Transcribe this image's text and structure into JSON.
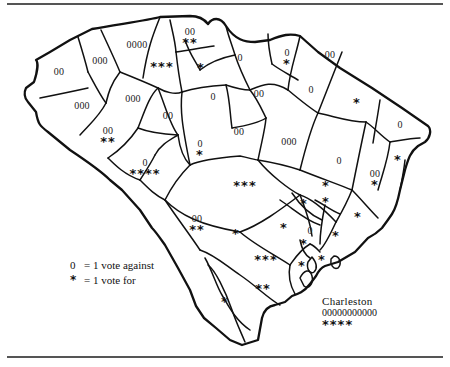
{
  "map": {
    "subject": "South Carolina counties — votes by county",
    "legend": {
      "against_symbol": "0",
      "against_label": "= 1 vote against",
      "for_symbol": "*",
      "for_label": "= 1 vote for"
    },
    "counties": [
      {
        "id": "c1",
        "against": "00",
        "for": ""
      },
      {
        "id": "c2",
        "against": "000",
        "for": ""
      },
      {
        "id": "c3",
        "against": "0000",
        "for": ""
      },
      {
        "id": "c4",
        "against": "",
        "for": "***"
      },
      {
        "id": "c5",
        "against": "00",
        "for": "**"
      },
      {
        "id": "c6",
        "against": "",
        "for": "*"
      },
      {
        "id": "c7",
        "against": "000",
        "for": ""
      },
      {
        "id": "c8",
        "against": "000",
        "for": ""
      },
      {
        "id": "c9",
        "against": "00",
        "for": ""
      },
      {
        "id": "c10",
        "against": "0",
        "for": ""
      },
      {
        "id": "c11",
        "against": "00",
        "for": "**"
      },
      {
        "id": "c12",
        "against": "0",
        "for": "****"
      },
      {
        "id": "c13",
        "against": "0",
        "for": "*"
      },
      {
        "id": "c14",
        "against": "0",
        "for": ""
      },
      {
        "id": "c15",
        "against": "0",
        "for": "*"
      },
      {
        "id": "c16",
        "against": "00",
        "for": ""
      },
      {
        "id": "c17",
        "against": "00",
        "for": ""
      },
      {
        "id": "c18",
        "against": "0",
        "for": ""
      },
      {
        "id": "c19",
        "against": "00",
        "for": ""
      },
      {
        "id": "c20",
        "against": "000",
        "for": ""
      },
      {
        "id": "c21",
        "against": "",
        "for": "*"
      },
      {
        "id": "c22",
        "against": "0",
        "for": ""
      },
      {
        "id": "c23",
        "against": "0",
        "for": ""
      },
      {
        "id": "c24",
        "against": "00",
        "for": "*"
      },
      {
        "id": "c25",
        "against": "",
        "for": "*"
      },
      {
        "id": "c26",
        "against": "",
        "for": "***"
      },
      {
        "id": "c27",
        "against": "00",
        "for": "**"
      },
      {
        "id": "c28",
        "against": "",
        "for": "*"
      },
      {
        "id": "c29",
        "against": "",
        "for": "*"
      },
      {
        "id": "c30",
        "against": "",
        "for": "*"
      },
      {
        "id": "c31",
        "against": "",
        "for": "*"
      },
      {
        "id": "c32",
        "against": "",
        "for": "*"
      },
      {
        "id": "c33",
        "against": "0",
        "for": ""
      },
      {
        "id": "c34",
        "against": "",
        "for": "*"
      },
      {
        "id": "c35",
        "against": "",
        "for": "*"
      },
      {
        "id": "c36",
        "against": "",
        "for": "*"
      },
      {
        "id": "c37",
        "against": "",
        "for": "*"
      },
      {
        "id": "c38",
        "against": "",
        "for": "***"
      },
      {
        "id": "c39",
        "against": "",
        "for": "*"
      },
      {
        "id": "c40",
        "against": "",
        "for": "**"
      },
      {
        "id": "c41",
        "against": "",
        "for": "*"
      }
    ],
    "charleston": {
      "name": "Charleston",
      "against": "00000000000",
      "for": "****"
    }
  }
}
